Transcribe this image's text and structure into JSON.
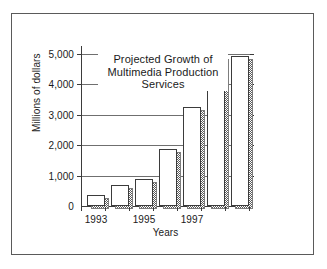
{
  "chart_data": {
    "type": "bar",
    "title": "Projected Growth of Multimedia Production Services",
    "title_lines": [
      "Projected Growth of",
      "Multimedia Production",
      "Services"
    ],
    "xlabel": "Years",
    "ylabel": "Millions of dollars",
    "ylim": [
      0,
      5000
    ],
    "ytick_labels": [
      "0",
      "1,000",
      "2,000",
      "3,000",
      "4,000",
      "5,000"
    ],
    "ytick_values": [
      0,
      1000,
      2000,
      3000,
      4000,
      5000
    ],
    "xtick_labels": [
      "1993",
      "1995",
      "1997"
    ],
    "xtick_label_indices": [
      0,
      2,
      4
    ],
    "categories": [
      "1993",
      "1994",
      "1995",
      "1996",
      "1997",
      "1998",
      "1999"
    ],
    "values": [
      370,
      690,
      890,
      1870,
      3250,
      4950,
      4950
    ],
    "series": [
      {
        "name": "Multimedia production services revenue",
        "values": [
          370,
          690,
          890,
          1870,
          3250,
          4950,
          4950
        ]
      }
    ],
    "grid": true,
    "gridlines_at": [
      1000,
      2000,
      3000,
      4000,
      5000
    ],
    "legend": null,
    "bar_style": "white fill with dithered gray drop shadow",
    "colors": {
      "bar_fill": "#ffffff",
      "bar_outline": "#3b3b3b",
      "bar_shadow": "#5c5c5c",
      "gridline": "#6f6f6f",
      "axis": "#3b3b3b",
      "text": "#1a1a1a",
      "frame": "#5a5a5a",
      "background": "#ffffff"
    }
  }
}
